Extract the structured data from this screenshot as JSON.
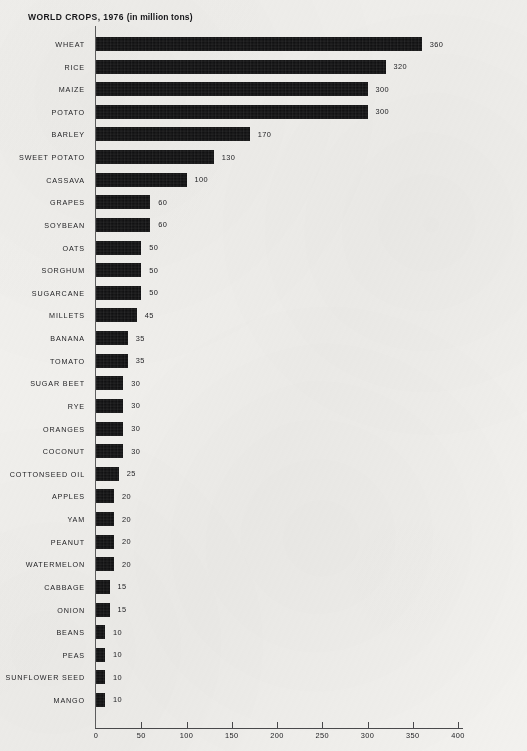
{
  "title": {
    "main": "WORLD CROPS, 1976",
    "unit_note": "(in million tons)"
  },
  "chart_data": {
    "type": "bar",
    "orientation": "horizontal",
    "title": "WORLD CROPS, 1976 (in million tons)",
    "xlabel": "",
    "ylabel": "",
    "xlim": [
      0,
      400
    ],
    "grid": false,
    "legend": null,
    "unit": "million tons",
    "xticks": [
      0,
      50,
      100,
      150,
      200,
      250,
      300,
      350,
      400
    ],
    "xtick_labels": [
      "0",
      "50",
      "100",
      "150",
      "200",
      "250",
      "300",
      "350",
      "400"
    ],
    "categories": [
      "WHEAT",
      "RICE",
      "MAIZE",
      "POTATO",
      "BARLEY",
      "SWEET POTATO",
      "CASSAVA",
      "GRAPES",
      "SOYBEAN",
      "OATS",
      "SORGHUM",
      "SUGARCANE",
      "MILLETS",
      "BANANA",
      "TOMATO",
      "SUGAR BEET",
      "RYE",
      "ORANGES",
      "COCONUT",
      "COTTONSEED OIL",
      "APPLES",
      "YAM",
      "PEANUT",
      "WATERMELON",
      "CABBAGE",
      "ONION",
      "BEANS",
      "PEAS",
      "SUNFLOWER SEED",
      "MANGO"
    ],
    "values": [
      360,
      320,
      300,
      300,
      170,
      130,
      100,
      60,
      60,
      50,
      50,
      50,
      45,
      35,
      35,
      30,
      30,
      30,
      30,
      25,
      20,
      20,
      20,
      20,
      15,
      15,
      10,
      10,
      10,
      10
    ],
    "value_labels": [
      "360",
      "320",
      "300",
      "300",
      "170",
      "130",
      "100",
      "60",
      "60",
      "50",
      "50",
      "50",
      "45",
      "35",
      "35",
      "30",
      "30",
      "30",
      "30",
      "25",
      "20",
      "20",
      "20",
      "20",
      "15",
      "15",
      "10",
      "10",
      "10",
      "10"
    ],
    "bar_color": "#0d0d0e",
    "background_color": "#f2f1ee"
  }
}
